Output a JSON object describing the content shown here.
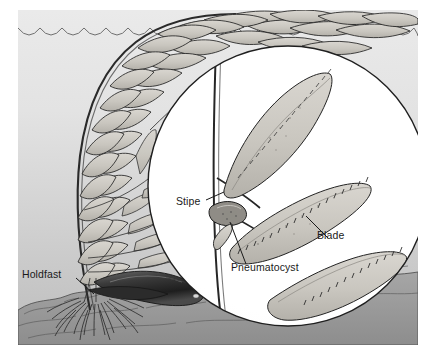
{
  "figure": {
    "background": {
      "water_top": "#eaeaea",
      "water_bottom": "#bdbdbd",
      "inset_fill": "#ffffff",
      "ink": "#1a1a1a",
      "seafloor": "#9a9a9a"
    }
  },
  "labels": [
    {
      "id": "holdfast",
      "text": "Holdfast"
    },
    {
      "id": "stipe",
      "text": "Stipe"
    },
    {
      "id": "pneumatocyst",
      "text": "Pneumatocyst"
    },
    {
      "id": "blade",
      "text": "Blade"
    }
  ],
  "parts": {
    "water_surface": "scalloped-wave-line",
    "seafloor": "rocky-substrate",
    "magnifier": "circular-inset"
  }
}
